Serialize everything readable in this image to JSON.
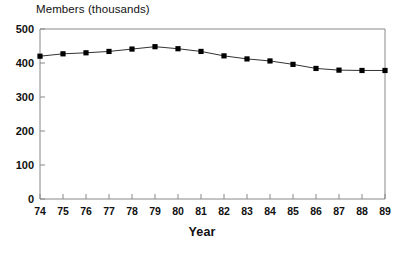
{
  "chart_data": {
    "type": "line",
    "title": "Members (thousands)",
    "xlabel": "Year",
    "ylabel": "",
    "categories": [
      "74",
      "75",
      "76",
      "77",
      "78",
      "79",
      "80",
      "81",
      "82",
      "83",
      "84",
      "85",
      "86",
      "87",
      "88",
      "89"
    ],
    "x": [
      74,
      75,
      76,
      77,
      78,
      79,
      80,
      81,
      82,
      83,
      84,
      85,
      86,
      87,
      88,
      89
    ],
    "values": [
      420,
      427,
      430,
      434,
      441,
      448,
      442,
      434,
      421,
      412,
      406,
      396,
      384,
      379,
      378,
      378
    ],
    "ylim": [
      0,
      500
    ],
    "xlim": [
      74,
      89
    ],
    "yticks": [
      0,
      100,
      200,
      300,
      400,
      500
    ],
    "ytick_labels": [
      "0",
      "100",
      "200",
      "300",
      "400",
      "500"
    ],
    "xticks": [
      74,
      75,
      76,
      77,
      78,
      79,
      80,
      81,
      82,
      83,
      84,
      85,
      86,
      87,
      88,
      89
    ],
    "grid": false,
    "legend": "none",
    "marker": "square",
    "line_color": "#333333",
    "marker_color": "#000000",
    "axis_color": "#888888"
  },
  "axes": {
    "y_title": "Members (thousands)",
    "x_title": "Year"
  }
}
